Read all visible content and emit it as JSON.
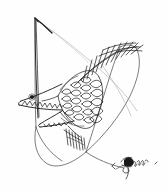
{
  "artwork": {
    "title": "Hand-drawn ink sketch of a stylized fish-bird creature",
    "medium": "pen and ink line drawing",
    "background_color": "#fefefe",
    "ink_color": "#1a1a1a",
    "light_ink_color": "#9a9a9a",
    "canvas": {
      "width": 168,
      "height": 191
    },
    "signature": {
      "present": true,
      "legible": false,
      "description": "illegible cursive scribble with a dense ink blot",
      "position": "lower-right"
    },
    "parts": [
      {
        "name": "apex-spike",
        "description": "sharp narrow wedge rising to a point at upper left"
      },
      {
        "name": "upper-jaw",
        "description": "long pointed beak with sawtooth teeth"
      },
      {
        "name": "lower-jaw",
        "description": "triangular lower jaw with sawtooth teeth"
      },
      {
        "name": "eye",
        "description": "small solid ink dot inside the head"
      },
      {
        "name": "scaled-body",
        "description": "overlapping rounded scales in vertical columns"
      },
      {
        "name": "dorsal-fin",
        "description": "spiky hatched fin along the upper back"
      },
      {
        "name": "ventral-fin",
        "description": "short vertical hatch-line fin below the body"
      },
      {
        "name": "enclosing-loop",
        "description": "large thin looping curve that crosses itself"
      },
      {
        "name": "thin-sweep",
        "description": "faint light-gray sweeping arc"
      }
    ]
  }
}
